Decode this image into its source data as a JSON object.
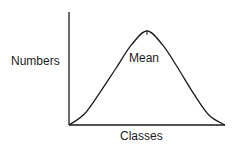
{
  "chart_data": {
    "type": "line",
    "title": "",
    "xlabel": "Classes",
    "ylabel": "Numbers",
    "curve": "normal-distribution",
    "x": [
      0,
      0.1,
      0.2,
      0.3,
      0.4,
      0.5,
      0.6,
      0.7,
      0.8,
      0.9,
      1.0
    ],
    "y": [
      0,
      0.12,
      0.35,
      0.6,
      0.85,
      1.0,
      0.85,
      0.6,
      0.33,
      0.1,
      0
    ],
    "annotations": [
      {
        "label": "Mean",
        "x": 0.5,
        "marker": "tick"
      }
    ],
    "xlim": [
      0,
      1
    ],
    "ylim": [
      0,
      1.2
    ],
    "grid": false,
    "ticks": false
  }
}
